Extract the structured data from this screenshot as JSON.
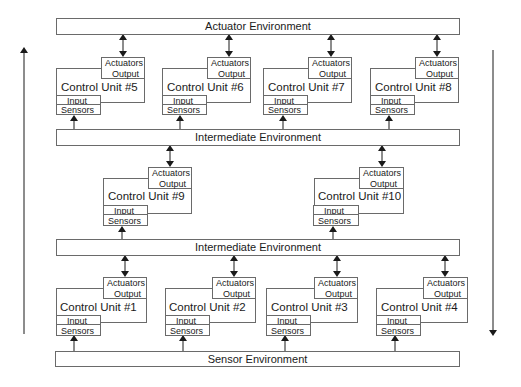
{
  "environments": {
    "actuator": "Actuator Environment",
    "intermediate_upper": "Intermediate Environment",
    "intermediate_lower": "Intermediate Environment",
    "sensor": "Sensor Environment"
  },
  "port_labels": {
    "actuators": "Actuators",
    "output": "Output",
    "input": "Input",
    "sensors": "Sensors"
  },
  "control_units": {
    "cu1": "Control Unit #1",
    "cu2": "Control Unit #2",
    "cu3": "Control Unit #3",
    "cu4": "Control Unit #4",
    "cu5": "Control Unit #5",
    "cu6": "Control Unit #6",
    "cu7": "Control Unit #7",
    "cu8": "Control Unit #8",
    "cu9": "Control Unit #9",
    "cu10": "Control Unit #10"
  },
  "flow_arrows": {
    "left": "upward",
    "right": "downward"
  },
  "colors": {
    "stroke": "#6a6a6a",
    "text": "#1a1a1a",
    "background": "#ffffff"
  }
}
